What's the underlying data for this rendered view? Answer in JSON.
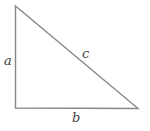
{
  "diagram": {
    "type": "right-triangle",
    "stroke_color": "#888888",
    "vertices": {
      "top": [
        15.5,
        6
      ],
      "right_angle": [
        15.5,
        108
      ],
      "bottom_right": [
        138,
        108.5
      ]
    },
    "labels": {
      "a": "a",
      "b": "b",
      "c": "c"
    }
  }
}
